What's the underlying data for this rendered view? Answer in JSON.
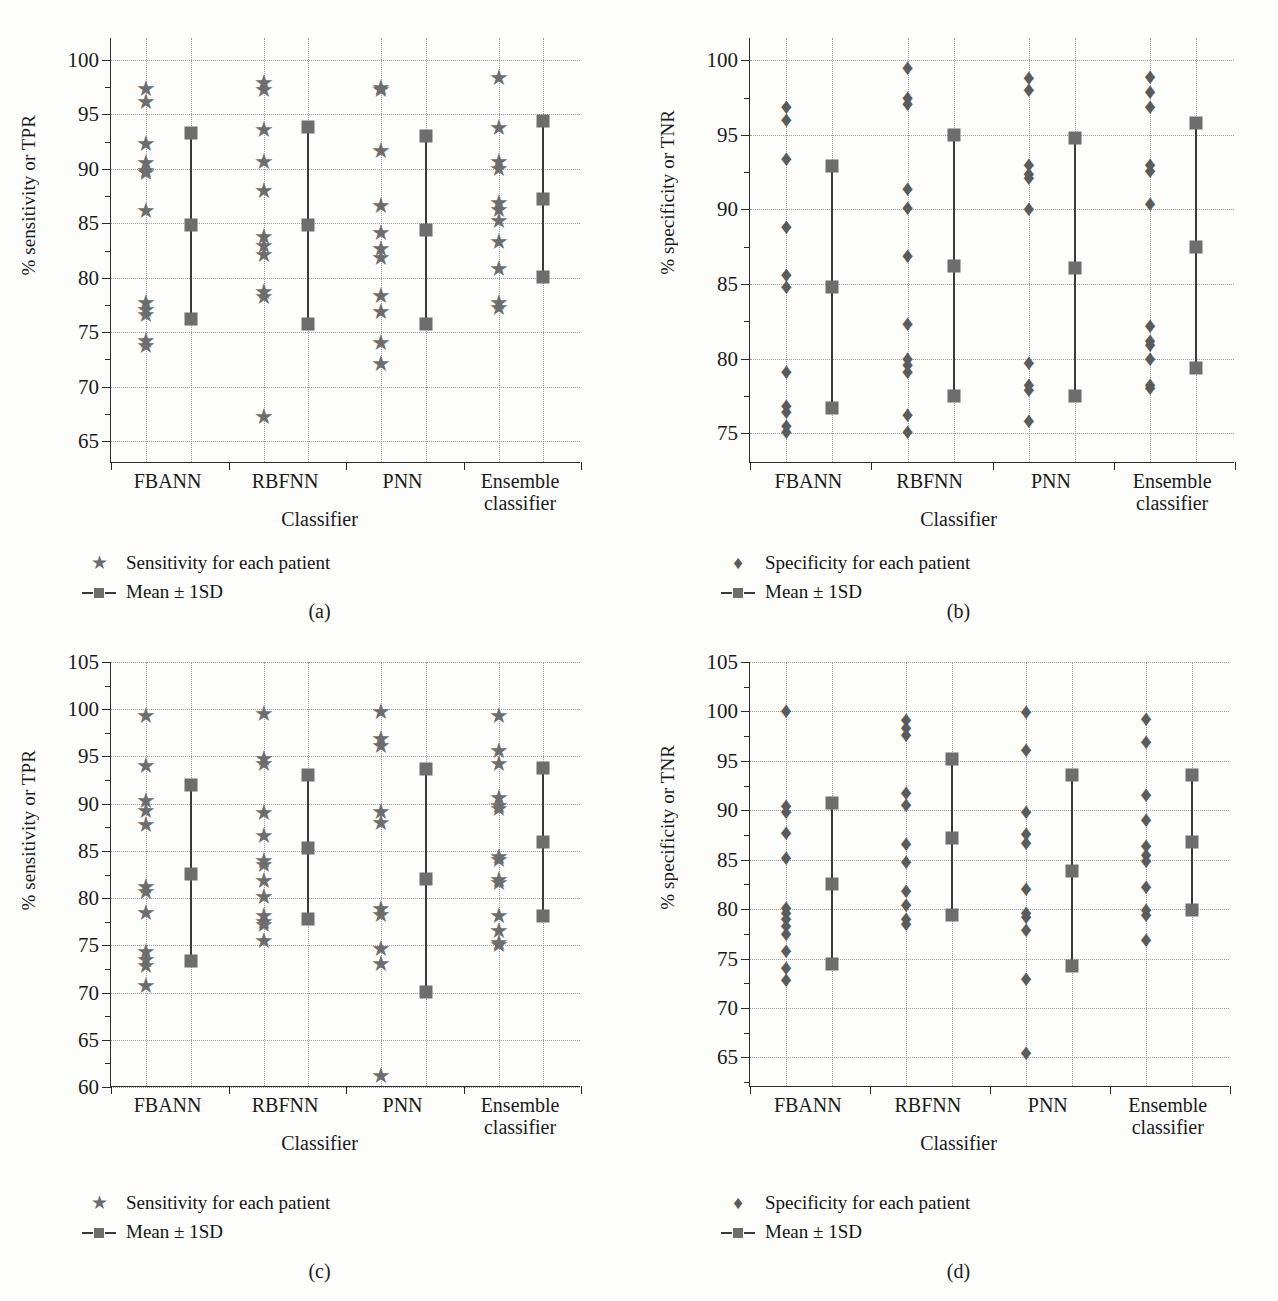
{
  "figure": {
    "panels": [
      {
        "id": "a",
        "caption": "(a)",
        "ylabel": "% sensitivity or TPR",
        "xlabel": "Classifier",
        "legend": [
          {
            "symbol": "star",
            "label": "Sensitivity for each patient"
          },
          {
            "symbol": "line-square",
            "label": "Mean ± 1SD"
          }
        ],
        "chart_data": {
          "type": "scatter",
          "title": "",
          "xlabel": "Classifier",
          "ylabel": "% sensitivity or TPR",
          "ylim": [
            63,
            102
          ],
          "yticks": [
            65,
            70,
            75,
            80,
            85,
            90,
            95,
            100
          ],
          "grid": true,
          "legend_position": "below-axes-left",
          "categories": [
            "FBANN",
            "RBFNN",
            "PNN",
            "Ensemble classifier"
          ],
          "series": [
            {
              "name": "Sensitivity for each patient",
              "marker": "star",
              "groups": [
                {
                  "category": "FBANN",
                  "values": [
                    97.3,
                    96.1,
                    92.3,
                    90.5,
                    89.8,
                    89.6,
                    86.1,
                    77.7,
                    77.0,
                    76.6,
                    74.2,
                    73.7
                  ]
                },
                {
                  "category": "RBFNN",
                  "values": [
                    97.9,
                    97.2,
                    93.6,
                    90.6,
                    88.0,
                    83.7,
                    82.9,
                    82.1,
                    78.7,
                    78.2,
                    67.2
                  ]
                },
                {
                  "category": "PNN",
                  "values": [
                    97.4,
                    97.2,
                    91.6,
                    86.6,
                    84.1,
                    82.6,
                    81.8,
                    78.3,
                    76.9,
                    74.0,
                    72.1
                  ]
                },
                {
                  "category": "Ensemble classifier",
                  "values": [
                    98.3,
                    93.7,
                    90.6,
                    90.0,
                    86.9,
                    86.2,
                    85.2,
                    83.3,
                    80.8,
                    77.7,
                    77.2
                  ]
                }
              ]
            },
            {
              "name": "Mean ± 1SD",
              "marker": "square-line",
              "groups": [
                {
                  "category": "FBANN",
                  "mean": 84.8,
                  "upper": 93.3,
                  "lower": 76.2
                },
                {
                  "category": "RBFNN",
                  "mean": 84.8,
                  "upper": 93.8,
                  "lower": 75.8
                },
                {
                  "category": "PNN",
                  "mean": 84.4,
                  "upper": 93.0,
                  "lower": 75.8
                },
                {
                  "category": "Ensemble classifier",
                  "mean": 87.2,
                  "upper": 94.4,
                  "lower": 80.1
                }
              ]
            }
          ]
        }
      },
      {
        "id": "b",
        "caption": "(b)",
        "ylabel": "% specificity or TNR",
        "xlabel": "Classifier",
        "legend": [
          {
            "symbol": "diamond",
            "label": "Specificity for each patient"
          },
          {
            "symbol": "line-square",
            "label": "Mean ± 1SD"
          }
        ],
        "chart_data": {
          "type": "scatter",
          "title": "",
          "xlabel": "Classifier",
          "ylabel": "% specificity or TNR",
          "ylim": [
            73,
            101.5
          ],
          "yticks": [
            75,
            80,
            85,
            90,
            95,
            100
          ],
          "grid": true,
          "legend_position": "below-axes-left",
          "categories": [
            "FBANN",
            "RBFNN",
            "PNN",
            "Ensemble classifier"
          ],
          "series": [
            {
              "name": "Specificity for each patient",
              "marker": "diamond",
              "groups": [
                {
                  "category": "FBANN",
                  "values": [
                    96.9,
                    96.0,
                    93.4,
                    88.8,
                    85.6,
                    84.8,
                    79.1,
                    76.8,
                    76.4,
                    75.5,
                    75.1
                  ]
                },
                {
                  "category": "RBFNN",
                  "values": [
                    99.5,
                    97.5,
                    97.1,
                    91.4,
                    90.1,
                    86.9,
                    82.3,
                    80.0,
                    79.6,
                    79.1,
                    76.2,
                    75.1
                  ]
                },
                {
                  "category": "PNN",
                  "values": [
                    98.8,
                    98.0,
                    93.0,
                    92.4,
                    92.1,
                    90.0,
                    79.7,
                    78.2,
                    77.9,
                    75.8
                  ]
                },
                {
                  "category": "Ensemble classifier",
                  "values": [
                    98.9,
                    97.9,
                    96.9,
                    93.0,
                    92.6,
                    90.4,
                    82.2,
                    81.2,
                    80.9,
                    80.0,
                    78.2,
                    78.0
                  ]
                }
              ]
            },
            {
              "name": "Mean ± 1SD",
              "marker": "square-line",
              "groups": [
                {
                  "category": "FBANN",
                  "mean": 84.8,
                  "upper": 92.9,
                  "lower": 76.7
                },
                {
                  "category": "RBFNN",
                  "mean": 86.2,
                  "upper": 95.0,
                  "lower": 77.5
                },
                {
                  "category": "PNN",
                  "mean": 86.1,
                  "upper": 94.8,
                  "lower": 77.5
                },
                {
                  "category": "Ensemble classifier",
                  "mean": 87.5,
                  "upper": 95.8,
                  "lower": 79.4
                }
              ]
            }
          ]
        }
      },
      {
        "id": "c",
        "caption": "(c)",
        "ylabel": "% sensitivity or TPR",
        "xlabel": "Classifier",
        "legend": [
          {
            "symbol": "star",
            "label": "Sensitivity for each patient"
          },
          {
            "symbol": "line-square",
            "label": "Mean ± 1SD"
          }
        ],
        "chart_data": {
          "type": "scatter",
          "title": "",
          "xlabel": "Classifier",
          "ylabel": "% sensitivity or TPR",
          "ylim": [
            60,
            105
          ],
          "yticks": [
            60,
            65,
            70,
            75,
            80,
            85,
            90,
            95,
            100,
            105
          ],
          "grid": true,
          "legend_position": "below-axes-left",
          "categories": [
            "FBANN",
            "RBFNN",
            "PNN",
            "Ensemble classifier"
          ],
          "series": [
            {
              "name": "Sensitivity for each patient",
              "marker": "star",
              "groups": [
                {
                  "category": "FBANN",
                  "values": [
                    99.3,
                    94.0,
                    90.3,
                    89.2,
                    87.7,
                    81.2,
                    80.7,
                    78.4,
                    74.3,
                    73.4,
                    72.8,
                    70.7
                  ]
                },
                {
                  "category": "RBFNN",
                  "values": [
                    99.5,
                    94.7,
                    94.2,
                    89.0,
                    86.6,
                    83.9,
                    83.5,
                    81.8,
                    80.1,
                    78.1,
                    77.5,
                    77.2,
                    75.5
                  ]
                },
                {
                  "category": "PNN",
                  "values": [
                    99.7,
                    96.9,
                    96.1,
                    89.1,
                    88.0,
                    78.8,
                    78.2,
                    74.6,
                    73.0,
                    61.2
                  ]
                },
                {
                  "category": "Ensemble classifier",
                  "values": [
                    99.3,
                    95.6,
                    94.2,
                    90.6,
                    89.8,
                    89.4,
                    84.4,
                    84.0,
                    81.9,
                    81.6,
                    78.1,
                    76.5,
                    75.2,
                    75.0
                  ]
                }
              ]
            },
            {
              "name": "Mean ± 1SD",
              "marker": "square-line",
              "groups": [
                {
                  "category": "FBANN",
                  "mean": 82.6,
                  "upper": 92.0,
                  "lower": 73.3
                },
                {
                  "category": "RBFNN",
                  "mean": 85.3,
                  "upper": 93.0,
                  "lower": 77.8
                },
                {
                  "category": "PNN",
                  "mean": 82.0,
                  "upper": 93.7,
                  "lower": 70.1
                },
                {
                  "category": "Ensemble classifier",
                  "mean": 85.9,
                  "upper": 93.8,
                  "lower": 78.1
                }
              ]
            }
          ]
        }
      },
      {
        "id": "d",
        "caption": "(d)",
        "ylabel": "% specificity or TNR",
        "xlabel": "Classifier",
        "legend": [
          {
            "symbol": "diamond",
            "label": "Specificity for each patient"
          },
          {
            "symbol": "line-square",
            "label": "Mean ± 1SD"
          }
        ],
        "chart_data": {
          "type": "scatter",
          "title": "",
          "xlabel": "Classifier",
          "ylabel": "% specificity or TNR",
          "ylim": [
            62,
            105
          ],
          "yticks": [
            65,
            70,
            75,
            80,
            85,
            90,
            95,
            100,
            105
          ],
          "grid": true,
          "legend_position": "below-axes-left",
          "categories": [
            "FBANN",
            "RBFNN",
            "PNN",
            "Ensemble classifier"
          ],
          "series": [
            {
              "name": "Specificity for each patient",
              "marker": "diamond",
              "groups": [
                {
                  "category": "FBANN",
                  "values": [
                    100.0,
                    90.4,
                    89.8,
                    87.7,
                    85.2,
                    80.1,
                    79.6,
                    79.0,
                    78.3,
                    77.5,
                    75.8,
                    74.0,
                    72.8
                  ]
                },
                {
                  "category": "RBFNN",
                  "values": [
                    99.1,
                    98.3,
                    97.6,
                    91.7,
                    90.5,
                    86.6,
                    84.8,
                    81.8,
                    80.4,
                    79.0,
                    78.5
                  ]
                },
                {
                  "category": "PNN",
                  "values": [
                    99.9,
                    96.1,
                    87.6,
                    86.7,
                    89.8,
                    82.0,
                    79.6,
                    79.2,
                    77.9,
                    72.9,
                    65.4
                  ]
                },
                {
                  "category": "Ensemble classifier",
                  "values": [
                    99.2,
                    96.9,
                    91.5,
                    89.0,
                    86.4,
                    85.5,
                    84.9,
                    82.2,
                    79.9,
                    79.4,
                    76.9
                  ]
                }
              ]
            },
            {
              "name": "Mean ± 1SD",
              "marker": "square-line",
              "groups": [
                {
                  "category": "FBANN",
                  "mean": 82.5,
                  "upper": 90.7,
                  "lower": 74.4
                },
                {
                  "category": "RBFNN",
                  "mean": 87.2,
                  "upper": 95.2,
                  "lower": 79.4
                },
                {
                  "category": "PNN",
                  "mean": 83.9,
                  "upper": 93.6,
                  "lower": 74.2
                },
                {
                  "category": "Ensemble classifier",
                  "mean": 86.8,
                  "upper": 93.6,
                  "lower": 79.9
                }
              ]
            }
          ]
        }
      }
    ],
    "colors": {
      "marker": "#6d6d6d",
      "diamond": "#5b5b5b",
      "axis": "#2b2b2b",
      "grid": "#9a9a9a",
      "background": "#fdfdfc"
    }
  }
}
